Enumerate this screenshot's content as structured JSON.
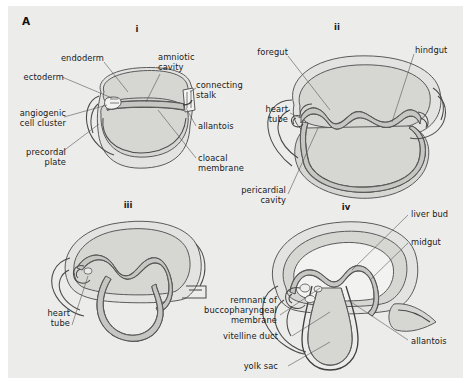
{
  "figure": {
    "panel_letter": "A",
    "background_color": "#ececeb",
    "line_color": "#4a4a4a",
    "fill_light": "#e2e2e0",
    "fill_mid": "#d4d4d1",
    "fill_dark": "#c2c2bf"
  },
  "stages": [
    {
      "numeral": "i",
      "labels": [
        {
          "key": "endoderm",
          "text": "endoderm"
        },
        {
          "key": "amniotic_cavity",
          "text": "amniotic\ncavity"
        },
        {
          "key": "ectoderm",
          "text": "ectoderm"
        },
        {
          "key": "connecting_stalk",
          "text": "connecting\nstalk"
        },
        {
          "key": "angiogenic_cell_cluster",
          "text": "angiogenic\ncell cluster"
        },
        {
          "key": "allantois",
          "text": "allantois"
        },
        {
          "key": "precordal_plate",
          "text": "precordal\nplate"
        },
        {
          "key": "cloacal_membrane",
          "text": "cloacal\nmembrane"
        }
      ]
    },
    {
      "numeral": "ii",
      "labels": [
        {
          "key": "foregut",
          "text": "foregut"
        },
        {
          "key": "hindgut",
          "text": "hindgut"
        },
        {
          "key": "heart_tube",
          "text": "heart\ntube"
        },
        {
          "key": "pericardial_cavity",
          "text": "pericardial\ncavity"
        }
      ]
    },
    {
      "numeral": "iii",
      "labels": [
        {
          "key": "heart_tube",
          "text": "heart\ntube"
        }
      ]
    },
    {
      "numeral": "iv",
      "labels": [
        {
          "key": "liver_bud",
          "text": "liver bud"
        },
        {
          "key": "midgut",
          "text": "midgut"
        },
        {
          "key": "remnant_buccopharyngeal_membrane",
          "text": "remnant of\nbuccopharyngeal\nmembrane"
        },
        {
          "key": "allantois",
          "text": "allantois"
        },
        {
          "key": "vitelline_duct",
          "text": "vitelline duct"
        },
        {
          "key": "yolk_sac",
          "text": "yolk sac"
        }
      ]
    }
  ]
}
